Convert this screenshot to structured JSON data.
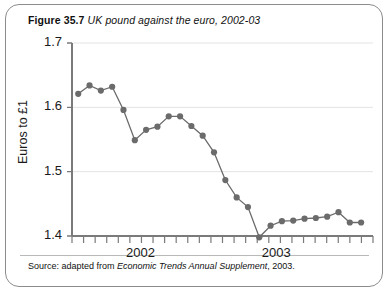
{
  "figure": {
    "number": "Figure 35.7",
    "caption": "UK pound against the euro, 2002-03",
    "source_prefix": "Source: adapted from",
    "source_italic": "Economic Trends Annual Supplement",
    "source_suffix": ", 2003."
  },
  "chart_data": {
    "type": "line",
    "title": "UK pound against the euro, 2002-03",
    "xlabel": "",
    "ylabel": "Euros to £1",
    "ylim": [
      1.4,
      1.7
    ],
    "yticks": [
      1.4,
      1.5,
      1.6,
      1.7
    ],
    "ytick_labels": [
      "1.4",
      "1.5",
      "1.6",
      "1.7"
    ],
    "xlim": [
      0,
      25
    ],
    "xtick_labels": [
      "2002",
      "2003"
    ],
    "xtick_label_positions": [
      5.5,
      17.5
    ],
    "minor_tick_count": 26,
    "grid": "horizontal",
    "legend": "none",
    "marker": "circle",
    "series_color": "#6b6b6b",
    "x": [
      0,
      1,
      2,
      3,
      4,
      5,
      6,
      7,
      8,
      9,
      10,
      11,
      12,
      13,
      14,
      15,
      16,
      17,
      18,
      19,
      20,
      21,
      22,
      23,
      24,
      25
    ],
    "values": [
      1.621,
      1.634,
      1.626,
      1.632,
      1.596,
      1.549,
      1.565,
      1.57,
      1.586,
      1.586,
      1.571,
      1.556,
      1.53,
      1.487,
      1.46,
      1.445,
      1.398,
      1.416,
      1.423,
      1.424,
      1.427,
      1.428,
      1.43,
      1.437,
      1.421,
      1.421
    ]
  },
  "colors": {
    "frame": "#8c8c8c",
    "axis": "#7a7a7a",
    "grid": "#e3e3e3",
    "line": "#6b6b6b",
    "text": "#111111"
  }
}
